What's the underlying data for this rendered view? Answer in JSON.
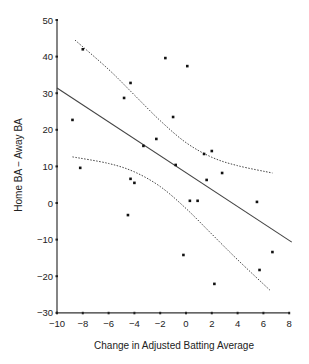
{
  "chart_data": {
    "type": "scatter",
    "title": "",
    "xlabel": "Change in Adjusted Batting Average",
    "ylabel": "Home BA − Away BA",
    "xlim": [
      -10,
      8
    ],
    "ylim": [
      -30,
      50
    ],
    "grid": false,
    "legend": null,
    "x_ticks": [
      -10,
      -8,
      -6,
      -4,
      -2,
      0,
      2,
      4,
      6,
      8
    ],
    "x_tick_labels": [
      "−10",
      "−8",
      "−6",
      "−4",
      "−2",
      "0",
      "2",
      "4",
      "6",
      "8"
    ],
    "y_ticks": [
      50,
      40,
      30,
      20,
      10,
      0,
      -10,
      -20,
      -30
    ],
    "y_tick_labels": [
      "50",
      "40",
      "30",
      "20",
      "10",
      "0",
      "−10",
      "−20",
      "−30"
    ],
    "series": [
      {
        "name": "points",
        "type": "scatter",
        "points": [
          [
            -8.0,
            42.0
          ],
          [
            -4.3,
            32.8
          ],
          [
            -4.8,
            28.7
          ],
          [
            -8.8,
            22.7
          ],
          [
            -8.2,
            9.6
          ],
          [
            -3.3,
            15.6
          ],
          [
            -2.3,
            17.5
          ],
          [
            -4.3,
            6.6
          ],
          [
            -4.0,
            5.5
          ],
          [
            -4.5,
            -3.3
          ],
          [
            -1.6,
            39.6
          ],
          [
            0.1,
            37.4
          ],
          [
            -1.0,
            23.5
          ],
          [
            -0.8,
            10.4
          ],
          [
            1.4,
            13.4
          ],
          [
            2.0,
            14.2
          ],
          [
            2.8,
            8.2
          ],
          [
            1.6,
            6.3
          ],
          [
            0.3,
            0.6
          ],
          [
            0.9,
            0.6
          ],
          [
            5.5,
            0.3
          ],
          [
            -0.2,
            -14.2
          ],
          [
            2.2,
            -22.1
          ],
          [
            5.7,
            -18.3
          ],
          [
            6.7,
            -13.4
          ]
        ]
      },
      {
        "name": "regression line",
        "type": "line",
        "style": "solid",
        "points": [
          [
            -10,
            31.4
          ],
          [
            8.2,
            -10.7
          ]
        ]
      },
      {
        "name": "upper confidence band",
        "type": "line",
        "style": "dotted",
        "points": [
          [
            -8.6,
            44.5
          ],
          [
            -6,
            36.5
          ],
          [
            -4,
            29.5
          ],
          [
            -2,
            22.5
          ],
          [
            0,
            16.5
          ],
          [
            2,
            12.5
          ],
          [
            4,
            10.2
          ],
          [
            6.7,
            8.2
          ]
        ]
      },
      {
        "name": "lower confidence band",
        "type": "line",
        "style": "dotted",
        "points": [
          [
            -8.8,
            12.6
          ],
          [
            -6,
            10.8
          ],
          [
            -4,
            8.5
          ],
          [
            -2,
            4.5
          ],
          [
            0,
            -1.5
          ],
          [
            2,
            -8.5
          ],
          [
            4,
            -15.5
          ],
          [
            6.5,
            -23.8
          ]
        ]
      }
    ]
  }
}
